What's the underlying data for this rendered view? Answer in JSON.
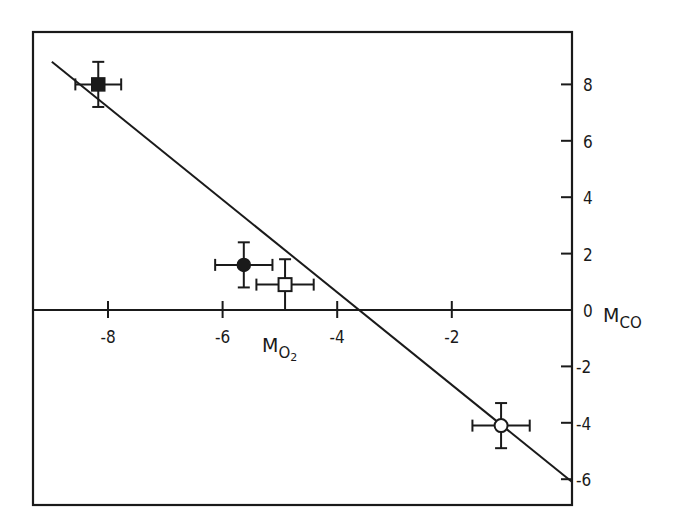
{
  "chart_data": {
    "type": "scatter",
    "title": "",
    "xlabel": "M_O2",
    "ylabel": "M_CO",
    "xlabel_main": "M",
    "xlabel_sub": "O",
    "xlabel_subsub": "2",
    "ylabel_main": "M",
    "ylabel_sub": "CO",
    "xlim": [
      -9.3,
      0.2
    ],
    "ylim": [
      -6.9,
      9.8
    ],
    "x_ticks": [
      -8,
      -6,
      -4,
      -2
    ],
    "x_tick_labels": [
      "-8",
      "-6",
      "-4",
      "-2"
    ],
    "y_ticks": [
      8,
      6,
      4,
      2,
      0,
      -2,
      -4,
      -6
    ],
    "y_tick_labels": [
      "8",
      "6",
      "4",
      "2",
      "0",
      "-2",
      "-4",
      "-6"
    ],
    "grid": false,
    "legend": null,
    "series": [
      {
        "name": "filled square",
        "marker": "square-filled",
        "x": -8.17,
        "y": 8.0,
        "xerr": 0.4,
        "yerr": 0.8
      },
      {
        "name": "filled circle",
        "marker": "circle-filled",
        "x": -5.63,
        "y": 1.6,
        "xerr": 0.5,
        "yerr": 0.8
      },
      {
        "name": "open square",
        "marker": "square-open",
        "x": -4.91,
        "y": 0.9,
        "xerr": 0.5,
        "yerr": 0.9
      },
      {
        "name": "open circle",
        "marker": "circle-open",
        "x": -1.14,
        "y": -4.1,
        "xerr": 0.5,
        "yerr": 0.8
      }
    ],
    "fit_line": {
      "x": [
        -8.98,
        0.1
      ],
      "y": [
        8.8,
        -6.1
      ]
    }
  },
  "colors": {
    "ink": "#1a1a1a",
    "background": "#ffffff"
  }
}
